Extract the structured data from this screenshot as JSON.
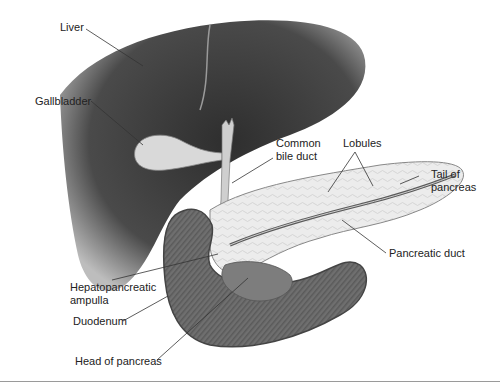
{
  "diagram": {
    "labels": [
      {
        "id": "liver",
        "text": "Liver"
      },
      {
        "id": "gallbladder",
        "text": "Gallbladder"
      },
      {
        "id": "common_bile_duct",
        "text": "Common\nbile duct"
      },
      {
        "id": "lobules",
        "text": "Lobules"
      },
      {
        "id": "tail_of_pancreas",
        "text": "Tail of\npancreas"
      },
      {
        "id": "pancreatic_duct",
        "text": "Pancreatic duct"
      },
      {
        "id": "hepatopancreatic_ampulla",
        "text": "Hepatopancreatic\nampulla"
      },
      {
        "id": "duodenum",
        "text": "Duodenum"
      },
      {
        "id": "head_of_pancreas",
        "text": "Head of pancreas"
      }
    ],
    "colors": {
      "liver": "#3a3a3a",
      "liver_edge": "#8a8a8a",
      "gallbladder": "#d8d8d8",
      "pancreas": "#e6e6e6",
      "duodenum": "#6e6e6e",
      "leader_lines": "#333333",
      "label_text": "#222222"
    }
  }
}
